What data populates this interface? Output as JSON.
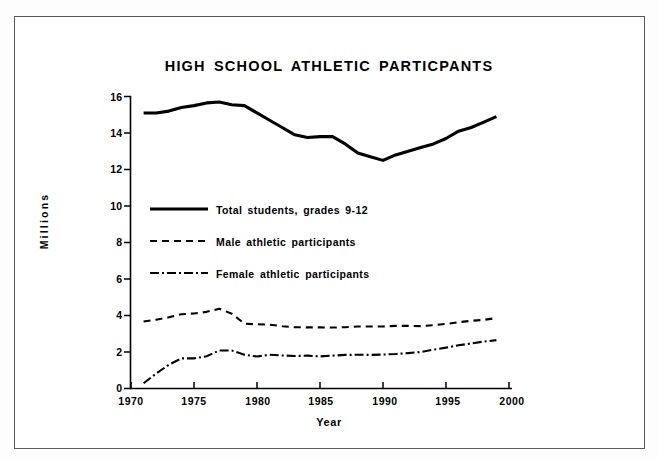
{
  "figure": {
    "border_color": "#5a5a5a",
    "background": "#ffffff"
  },
  "chart_data": {
    "type": "line",
    "title": "HIGH SCHOOL ATHLETIC PARTICPANTS",
    "xlabel": "Year",
    "ylabel": "Millions",
    "xlim": [
      1970,
      2000
    ],
    "ylim": [
      0,
      16
    ],
    "xticks": [
      "1970",
      "1975",
      "1980",
      "1985",
      "1990",
      "1995",
      "2000"
    ],
    "xtick_values": [
      1970,
      1975,
      1980,
      1985,
      1990,
      1995,
      2000
    ],
    "yticks": [
      "0",
      "2",
      "4",
      "6",
      "8",
      "10",
      "12",
      "14",
      "16"
    ],
    "ytick_values": [
      0,
      2,
      4,
      6,
      8,
      10,
      12,
      14,
      16
    ],
    "grid": false,
    "legend_position": "center-left",
    "line_color": "#000000",
    "series": [
      {
        "name": "Total students, grades 9-12",
        "style": "solid",
        "x": [
          1971,
          1972,
          1973,
          1974,
          1975,
          1976,
          1977,
          1978,
          1979,
          1980,
          1981,
          1982,
          1983,
          1984,
          1985,
          1986,
          1987,
          1988,
          1989,
          1990,
          1991,
          1992,
          1993,
          1994,
          1995,
          1996,
          1997,
          1998,
          1999
        ],
        "values": [
          15.1,
          15.1,
          15.2,
          15.4,
          15.5,
          15.65,
          15.7,
          15.55,
          15.5,
          15.1,
          14.7,
          14.3,
          13.9,
          13.75,
          13.8,
          13.8,
          13.4,
          12.9,
          12.7,
          12.5,
          12.8,
          13.0,
          13.2,
          13.4,
          13.7,
          14.1,
          14.3,
          14.6,
          14.9
        ]
      },
      {
        "name": "Male athletic participants",
        "style": "dashed",
        "x": [
          1971,
          1972,
          1973,
          1974,
          1975,
          1976,
          1977,
          1978,
          1979,
          1980,
          1981,
          1982,
          1983,
          1984,
          1985,
          1986,
          1987,
          1988,
          1989,
          1990,
          1991,
          1992,
          1993,
          1994,
          1995,
          1996,
          1997,
          1998,
          1999
        ],
        "values": [
          3.67,
          3.77,
          3.9,
          4.07,
          4.11,
          4.2,
          4.37,
          4.1,
          3.55,
          3.52,
          3.5,
          3.41,
          3.36,
          3.35,
          3.35,
          3.34,
          3.36,
          3.4,
          3.4,
          3.4,
          3.43,
          3.43,
          3.42,
          3.47,
          3.54,
          3.63,
          3.71,
          3.76,
          3.86
        ]
      },
      {
        "name": "Female athletic participants",
        "style": "dashdot",
        "x": [
          1971,
          1972,
          1973,
          1974,
          1975,
          1976,
          1977,
          1978,
          1979,
          1980,
          1981,
          1982,
          1983,
          1984,
          1985,
          1986,
          1987,
          1988,
          1989,
          1990,
          1991,
          1992,
          1993,
          1994,
          1995,
          1996,
          1997,
          1998,
          1999
        ],
        "values": [
          0.29,
          0.82,
          1.3,
          1.65,
          1.65,
          1.77,
          2.08,
          2.08,
          1.85,
          1.75,
          1.85,
          1.81,
          1.78,
          1.8,
          1.76,
          1.8,
          1.84,
          1.85,
          1.84,
          1.86,
          1.89,
          1.94,
          2.0,
          2.13,
          2.24,
          2.37,
          2.47,
          2.57,
          2.65
        ]
      }
    ]
  },
  "legend": [
    {
      "label": "Total students,  grades  9-12",
      "style": "solid"
    },
    {
      "label": "Male  athletic  participants",
      "style": "dashed"
    },
    {
      "label": "Female  athletic  participants",
      "style": "dashdot"
    }
  ]
}
